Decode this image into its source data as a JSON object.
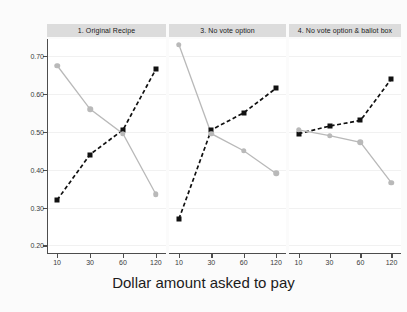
{
  "chart_data": {
    "type": "line",
    "title": "",
    "xlabel": "Dollar amount asked to pay",
    "ylabel": "",
    "x": [
      10,
      30,
      60,
      120
    ],
    "x_tick_labels": [
      "10",
      "30",
      "60",
      "120"
    ],
    "y_tick_labels": [
      "0.70",
      "0.60",
      "0.50",
      "0.40",
      "0.30",
      "0.20"
    ],
    "y_ticks": [
      0.7,
      0.6,
      0.5,
      0.4,
      0.3,
      0.2
    ],
    "ylim": [
      0.18,
      0.745
    ],
    "grid": true,
    "legend": "none",
    "panel_layout": "facet-columns",
    "colors": {
      "series_black": "#111111",
      "series_gray": "#b9b9b9",
      "strip_background": "#dcdcdc",
      "panel_background": "#ffffff",
      "figure_background": "#fbfbfb",
      "axis": "#4d4d4d",
      "gridline": "#f1f1f1"
    },
    "panels": [
      {
        "title": "1. Original Recipe",
        "series": [
          {
            "name": "series_black",
            "style": "dashed",
            "marker": "square",
            "color": "#111111",
            "values": [
              0.32,
              0.44,
              0.505,
              0.665
            ]
          },
          {
            "name": "series_gray",
            "style": "solid",
            "marker": "circle",
            "color": "#b9b9b9",
            "values": [
              0.675,
              0.56,
              0.495,
              0.335
            ]
          }
        ]
      },
      {
        "title": "3. No vote option",
        "series": [
          {
            "name": "series_black",
            "style": "dashed",
            "marker": "square",
            "color": "#111111",
            "values": [
              0.27,
              0.505,
              0.55,
              0.615
            ]
          },
          {
            "name": "series_gray",
            "style": "solid",
            "marker": "circle",
            "color": "#b9b9b9",
            "values": [
              0.73,
              0.495,
              0.45,
              0.39
            ]
          }
        ]
      },
      {
        "title": "4. No vote option & ballot box",
        "series": [
          {
            "name": "series_black",
            "style": "dashed",
            "marker": "square",
            "color": "#111111",
            "values": [
              0.495,
              0.515,
              0.53,
              0.64
            ]
          },
          {
            "name": "series_gray",
            "style": "solid",
            "marker": "circle",
            "color": "#b9b9b9",
            "values": [
              0.505,
              0.49,
              0.472,
              0.365
            ]
          }
        ]
      }
    ]
  }
}
